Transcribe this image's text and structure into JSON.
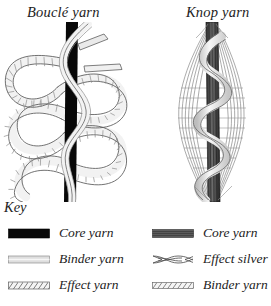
{
  "diagram": {
    "kind": "textile-fancy-yarn-structure-diagram",
    "panels": [
      {
        "id": "boucle",
        "title": "Bouclé yarn",
        "description": "Straight black core yarn with an effect yarn forming large irregular loops along both sides and a binder yarn spiralling around the core.",
        "components": [
          "Core yarn",
          "Binder yarn",
          "Effect yarn"
        ]
      },
      {
        "id": "knop",
        "title": "Knop yarn",
        "description": "Dark core yarn with a bunched knop of effect silver fibres gathered in the centre and a binder yarn wrapped in a spiral.",
        "components": [
          "Core yarn",
          "Effect silver",
          "Binder yarn"
        ]
      }
    ]
  },
  "key": {
    "heading": "Key",
    "left_column": [
      {
        "label": "Core yarn",
        "swatch": "solid-black-bar",
        "color": "#080808"
      },
      {
        "label": "Binder yarn",
        "swatch": "light-gray-bar",
        "color": "#d9d9d9"
      },
      {
        "label": "Effect yarn",
        "swatch": "diagonal-hatch-bar",
        "color": "#efefef"
      }
    ],
    "right_column": [
      {
        "label": "Core yarn",
        "swatch": "dark-gray-bar",
        "color": "#5a5a5a"
      },
      {
        "label": "Effect silver",
        "swatch": "crossed-strands-bar",
        "color": "#ffffff"
      },
      {
        "label": "Binder yarn",
        "swatch": "diagonal-hatch-bar",
        "color": "#efefef"
      }
    ]
  },
  "colors": {
    "background": "#ffffff",
    "ink": "#1c1c1c",
    "core_black": "#080808",
    "core_gray": "#5a5a5a",
    "binder_light": "#d9d9d9",
    "effect_fill": "#efefef",
    "outline": "#4a4a4a"
  }
}
